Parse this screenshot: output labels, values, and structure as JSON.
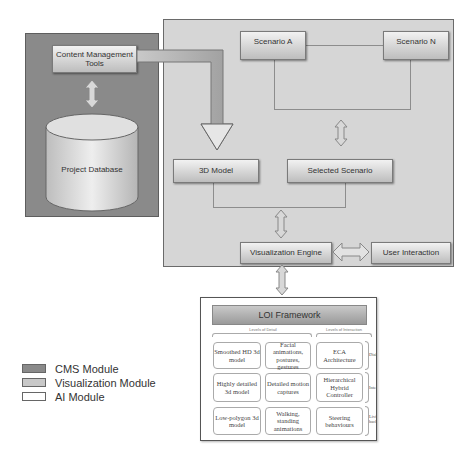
{
  "diagram": {
    "cms_module": {
      "content_tools": "Content Management Tools",
      "database": "Project Database"
    },
    "visualization_module": {
      "scenario_a": "Scenario A",
      "scenario_n": "Scenario N",
      "model_3d": "3D Model",
      "selected_scenario": "Selected Scenario",
      "engine": "Visualization Engine",
      "user_interaction": "User Interaction"
    },
    "ai_module": {
      "title": "LOI Framework",
      "column_groups": [
        "Levels of Detail",
        "Levels of Interaction"
      ],
      "rows": [
        {
          "cells": [
            "Smoothed HD 3d model",
            "Facial animations, postures, gestures",
            "ECA Architecture"
          ],
          "label": "Dialogue"
        },
        {
          "cells": [
            "Highly detailed 3d model",
            "Detailed motion captures",
            "Hierarchical Hybrid Controller"
          ],
          "label": "Interaction"
        },
        {
          "cells": [
            "Low-polygon 3d model",
            "Walking, standing animations",
            "Steering behaviours"
          ],
          "label": "Living background"
        }
      ]
    }
  },
  "legend": [
    {
      "label": "CMS Module",
      "color": "#8a8a8a"
    },
    {
      "label": "Visualization Module",
      "color": "#c8c8c8"
    },
    {
      "label": "AI Module",
      "color": "#ffffff"
    }
  ]
}
